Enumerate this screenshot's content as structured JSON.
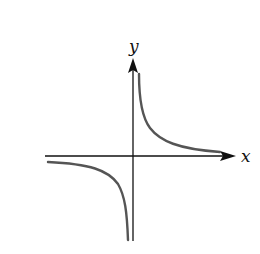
{
  "figure": {
    "x_axis_label": "x",
    "y_axis_label": "y",
    "colors": {
      "axis": "#111111",
      "curve": "#555555",
      "background": "#ffffff"
    }
  }
}
